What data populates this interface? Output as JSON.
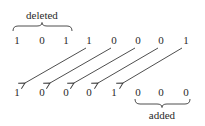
{
  "diagram": {
    "top_label": "deleted",
    "bottom_label": "added",
    "original_bits": [
      "1",
      "0",
      "1",
      "1",
      "0",
      "0",
      "0",
      "1"
    ],
    "shifted_bits": [
      "1",
      "0",
      "0",
      "0",
      "1",
      "0",
      "0",
      "0"
    ],
    "shift_amount": 3,
    "deleted_indices": [
      0,
      1,
      2
    ],
    "added_indices": [
      5,
      6,
      7
    ],
    "arrows": [
      {
        "from": 3,
        "to": 0
      },
      {
        "from": 4,
        "to": 1
      },
      {
        "from": 5,
        "to": 2
      },
      {
        "from": 6,
        "to": 3
      },
      {
        "from": 7,
        "to": 4
      }
    ]
  }
}
